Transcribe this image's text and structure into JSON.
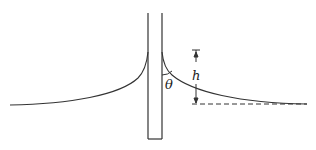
{
  "diagram": {
    "labels": {
      "height": "h",
      "contact_angle": "θ"
    },
    "colors": {
      "stroke": "#333333",
      "background": "#ffffff"
    }
  }
}
